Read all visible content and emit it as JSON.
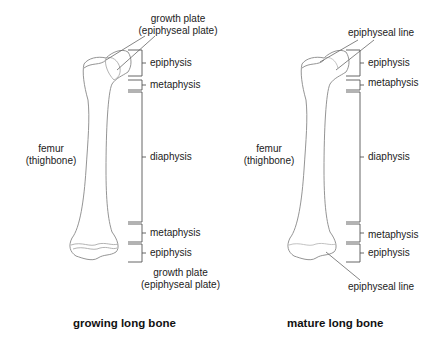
{
  "diagrams": [
    {
      "id": "growing",
      "caption": "growing long bone",
      "bone_label": [
        "femur",
        "(thighbone)"
      ],
      "top_callout": [
        "growth plate",
        "(epiphyseal plate)"
      ],
      "bottom_callout": [
        "growth plate",
        "(epiphyseal plate)"
      ],
      "regions": [
        "epiphysis",
        "metaphysis",
        "diaphysis",
        "metaphysis",
        "epiphysis"
      ]
    },
    {
      "id": "mature",
      "caption": "mature long bone",
      "bone_label": [
        "femur",
        "(thighbone)"
      ],
      "top_callout": [
        "epiphyseal line"
      ],
      "bottom_callout": [
        "epiphyseal line"
      ],
      "regions": [
        "epiphysis",
        "metaphysis",
        "diaphysis",
        "metaphysis",
        "epiphysis"
      ]
    }
  ],
  "colors": {
    "line": "#888888",
    "bone_fill": "#ffffff",
    "text": "#222222"
  }
}
